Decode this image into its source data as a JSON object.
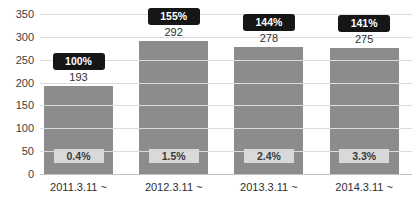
{
  "chart_data": {
    "type": "bar",
    "title": "",
    "xlabel": "",
    "ylabel": "",
    "categories": [
      "2011.3.11 ~",
      "2012.3.11 ~",
      "2013.3.11 ~",
      "2014.3.11 ~"
    ],
    "values": [
      193,
      292,
      278,
      275
    ],
    "percent_badges": [
      "100%",
      "155%",
      "144%",
      "141%"
    ],
    "inner_labels": [
      "0.4%",
      "1.5%",
      "2.4%",
      "3.3%"
    ],
    "ylim": [
      0,
      350
    ],
    "yticks": [
      0,
      50,
      100,
      150,
      200,
      250,
      300,
      350
    ],
    "grid": true,
    "legend": "none",
    "colors": {
      "bar_fill": "#8c8c8c",
      "gridline": "#dcdcdc",
      "axis_line": "#c2c2c2",
      "badge_bg": "#161616",
      "badge_text": "#ffffff",
      "inner_label_bg": "#d9d9d9",
      "inner_label_text": "#3a3a3a",
      "tick_text": "#3d3d3d",
      "background": "#ffffff"
    }
  }
}
